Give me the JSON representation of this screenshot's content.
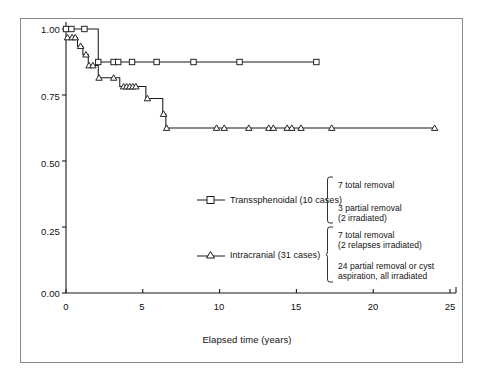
{
  "chart_data": {
    "type": "line",
    "subtype": "kaplan-meier-step",
    "title": "",
    "xlabel": "Elapsed time (years)",
    "ylabel": "",
    "xlim": [
      0,
      25
    ],
    "ylim": [
      0.0,
      1.0
    ],
    "xticks": [
      0,
      5,
      10,
      15,
      20,
      25
    ],
    "xtick_labels": [
      "0",
      "5",
      "10",
      "15",
      "20",
      "25"
    ],
    "yticks": [
      0.0,
      0.25,
      0.5,
      0.75,
      1.0
    ],
    "ytick_labels": [
      "0.00",
      "0.25",
      "0.50",
      "0.75",
      "1.00"
    ],
    "grid": false,
    "legend_position": "center",
    "series": [
      {
        "name": "Transsphenoidal (10 cases)",
        "marker": "square-open",
        "n": 10,
        "steps": [
          {
            "x": 0.0,
            "y": 1.0
          },
          {
            "x": 2.1,
            "y": 1.0
          },
          {
            "x": 2.1,
            "y": 0.875
          },
          {
            "x": 16.3,
            "y": 0.875
          }
        ],
        "censor_points": [
          {
            "x": 0.0,
            "y": 1.0
          },
          {
            "x": 0.35,
            "y": 1.0
          },
          {
            "x": 1.2,
            "y": 1.0
          },
          {
            "x": 2.1,
            "y": 0.875
          },
          {
            "x": 3.1,
            "y": 0.875
          },
          {
            "x": 3.4,
            "y": 0.875
          },
          {
            "x": 4.3,
            "y": 0.875
          },
          {
            "x": 5.9,
            "y": 0.875
          },
          {
            "x": 8.3,
            "y": 0.875
          },
          {
            "x": 11.3,
            "y": 0.875
          },
          {
            "x": 16.3,
            "y": 0.875
          }
        ]
      },
      {
        "name": "Intracranial (31 cases)",
        "marker": "triangle-open",
        "n": 31,
        "steps": [
          {
            "x": 0.0,
            "y": 0.968
          },
          {
            "x": 0.75,
            "y": 0.968
          },
          {
            "x": 0.75,
            "y": 0.935
          },
          {
            "x": 1.1,
            "y": 0.935
          },
          {
            "x": 1.1,
            "y": 0.903
          },
          {
            "x": 1.45,
            "y": 0.903
          },
          {
            "x": 1.45,
            "y": 0.862
          },
          {
            "x": 2.1,
            "y": 0.862
          },
          {
            "x": 2.1,
            "y": 0.815
          },
          {
            "x": 3.5,
            "y": 0.815
          },
          {
            "x": 3.5,
            "y": 0.782
          },
          {
            "x": 5.2,
            "y": 0.782
          },
          {
            "x": 5.2,
            "y": 0.737
          },
          {
            "x": 6.3,
            "y": 0.737
          },
          {
            "x": 6.3,
            "y": 0.678
          },
          {
            "x": 6.5,
            "y": 0.678
          },
          {
            "x": 6.5,
            "y": 0.625
          },
          {
            "x": 24.0,
            "y": 0.625
          }
        ],
        "censor_points": [
          {
            "x": 0.1,
            "y": 0.968
          },
          {
            "x": 0.4,
            "y": 0.968
          },
          {
            "x": 0.6,
            "y": 0.968
          },
          {
            "x": 0.95,
            "y": 0.935
          },
          {
            "x": 1.3,
            "y": 0.903
          },
          {
            "x": 1.5,
            "y": 0.862
          },
          {
            "x": 1.75,
            "y": 0.862
          },
          {
            "x": 2.15,
            "y": 0.815
          },
          {
            "x": 3.1,
            "y": 0.815
          },
          {
            "x": 3.75,
            "y": 0.782
          },
          {
            "x": 3.95,
            "y": 0.782
          },
          {
            "x": 4.15,
            "y": 0.782
          },
          {
            "x": 4.35,
            "y": 0.782
          },
          {
            "x": 4.55,
            "y": 0.782
          },
          {
            "x": 5.3,
            "y": 0.737
          },
          {
            "x": 6.35,
            "y": 0.678
          },
          {
            "x": 6.55,
            "y": 0.625
          },
          {
            "x": 9.8,
            "y": 0.625
          },
          {
            "x": 10.3,
            "y": 0.625
          },
          {
            "x": 11.9,
            "y": 0.625
          },
          {
            "x": 13.2,
            "y": 0.625
          },
          {
            "x": 13.5,
            "y": 0.625
          },
          {
            "x": 14.4,
            "y": 0.625
          },
          {
            "x": 14.7,
            "y": 0.625
          },
          {
            "x": 15.3,
            "y": 0.625
          },
          {
            "x": 17.3,
            "y": 0.625
          },
          {
            "x": 24.0,
            "y": 0.625
          }
        ]
      }
    ],
    "legend_entries": [
      {
        "label": "Transsphenoidal (10 cases)",
        "marker": "square-open",
        "annotation_lines": [
          "7 total removal",
          "3 partial removal",
          "(2 irradiated)"
        ]
      },
      {
        "label": "Intracranial (31 cases)",
        "marker": "triangle-open",
        "annotation_lines": [
          "7 total removal",
          "(2 relapses irradiated)",
          "24 partial removal or cyst",
          "aspiration, all irradiated"
        ]
      }
    ]
  },
  "colors": {
    "line": "#1a1a1a",
    "frame": "#8a8a8a",
    "text": "#111111",
    "background": "#ffffff"
  }
}
